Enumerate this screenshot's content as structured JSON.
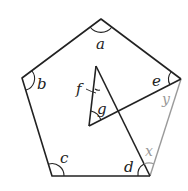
{
  "diagram": {
    "type": "geometry",
    "colors": {
      "stroke": "#222222",
      "grey_stroke": "#9a9a9a",
      "background": "#ffffff"
    },
    "pentagon_vertices": {
      "top": [
        101,
        19
      ],
      "left": [
        22,
        78
      ],
      "right": [
        181,
        79
      ],
      "bottom_left": [
        52,
        176
      ],
      "bottom_right": [
        150,
        176
      ]
    },
    "triangle": {
      "apex": [
        96,
        66
      ],
      "lower_left": [
        89,
        126
      ]
    },
    "labels": {
      "a": "a",
      "b": "b",
      "c": "c",
      "d": "d",
      "e": "e",
      "f": "f",
      "g": "g",
      "x": "x",
      "y": "y"
    }
  }
}
